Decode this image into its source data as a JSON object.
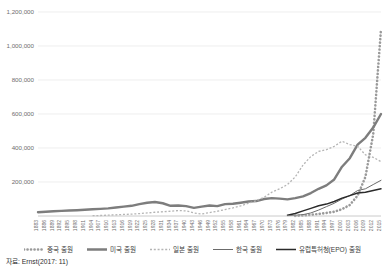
{
  "title_fragment": "",
  "source_note": "자료: Ernst(2017: 11)",
  "legend": {
    "position": "bottom",
    "items": [
      {
        "label": "중국 출원",
        "style": "dotted-thick",
        "color": "#9a9a9a",
        "key": "china"
      },
      {
        "label": "미국 출원",
        "style": "solid-thick",
        "color": "#7d7d7d",
        "key": "usa"
      },
      {
        "label": "일본 출원",
        "style": "dotted-thin",
        "color": "#b4b4b4",
        "key": "japan"
      },
      {
        "label": "한국 출원",
        "style": "solid-thin",
        "color": "#6b6b6b",
        "key": "korea"
      },
      {
        "label": "유럽특허청(EPO) 출원",
        "style": "solid-black",
        "color": "#2b2b2b",
        "key": "epo"
      }
    ]
  },
  "chart_data": {
    "type": "line",
    "title": "",
    "xlabel": "",
    "ylabel": "",
    "grid": true,
    "ylim": [
      0,
      1200000
    ],
    "yticks": [
      200000,
      400000,
      600000,
      800000,
      1000000,
      1200000
    ],
    "ytick_labels": [
      "200,000",
      "400,000",
      "600,000",
      "800,000",
      "1,000,000",
      "1,200,000"
    ],
    "xlim": [
      1883,
      2015
    ],
    "xtick_labels": [
      "1883",
      "1886",
      "1889",
      "1892",
      "1895",
      "1898",
      "1901",
      "1904",
      "1907",
      "1910",
      "1913",
      "1916",
      "1919",
      "1922",
      "1925",
      "1928",
      "1931",
      "1934",
      "1937",
      "1940",
      "1943",
      "1946",
      "1949",
      "1952",
      "1955",
      "1958",
      "1961",
      "1964",
      "1967",
      "1970",
      "1973",
      "1976",
      "1979",
      "1982",
      "1985",
      "1988",
      "1991",
      "1994",
      "1997",
      "2000",
      "2003",
      "2006",
      "2009",
      "2012",
      "2015"
    ],
    "x": [
      1883,
      1886,
      1889,
      1892,
      1895,
      1898,
      1901,
      1904,
      1907,
      1910,
      1913,
      1916,
      1919,
      1922,
      1925,
      1928,
      1931,
      1934,
      1937,
      1940,
      1943,
      1946,
      1949,
      1952,
      1955,
      1958,
      1961,
      1964,
      1967,
      1970,
      1973,
      1976,
      1979,
      1982,
      1985,
      1988,
      1991,
      1994,
      1997,
      2000,
      2003,
      2006,
      2009,
      2012,
      2015
    ],
    "series": [
      {
        "name": "중국 출원",
        "key": "china",
        "color": "#9a9a9a",
        "style": "dotted-thick",
        "values": [
          null,
          null,
          null,
          null,
          null,
          null,
          null,
          null,
          null,
          null,
          null,
          null,
          null,
          null,
          null,
          null,
          null,
          null,
          null,
          null,
          null,
          null,
          null,
          null,
          null,
          null,
          null,
          null,
          null,
          null,
          null,
          null,
          null,
          1000,
          3000,
          7000,
          12000,
          18000,
          25000,
          40000,
          65000,
          120000,
          230000,
          480000,
          1100000
        ]
      },
      {
        "name": "미국 출원",
        "key": "usa",
        "color": "#7d7d7d",
        "style": "solid-thick",
        "values": [
          22000,
          25000,
          28000,
          30000,
          32000,
          34000,
          37000,
          40000,
          42000,
          45000,
          50000,
          55000,
          60000,
          70000,
          78000,
          82000,
          75000,
          60000,
          62000,
          58000,
          48000,
          55000,
          62000,
          58000,
          70000,
          72000,
          78000,
          85000,
          88000,
          100000,
          105000,
          102000,
          98000,
          105000,
          115000,
          135000,
          160000,
          180000,
          215000,
          290000,
          340000,
          420000,
          460000,
          520000,
          600000
        ]
      },
      {
        "name": "일본 출원",
        "key": "japan",
        "color": "#b4b4b4",
        "style": "dotted-thin",
        "values": [
          null,
          null,
          null,
          null,
          null,
          null,
          null,
          2000,
          3000,
          5000,
          7000,
          9000,
          11000,
          14000,
          18000,
          22000,
          25000,
          28000,
          32000,
          30000,
          18000,
          12000,
          20000,
          28000,
          38000,
          48000,
          60000,
          75000,
          90000,
          110000,
          140000,
          160000,
          185000,
          230000,
          300000,
          350000,
          380000,
          390000,
          410000,
          440000,
          420000,
          410000,
          360000,
          345000,
          320000
        ]
      },
      {
        "name": "한국 출원",
        "key": "korea",
        "color": "#6b6b6b",
        "style": "solid-thin",
        "values": [
          null,
          null,
          null,
          null,
          null,
          null,
          null,
          null,
          null,
          null,
          null,
          null,
          null,
          null,
          null,
          null,
          null,
          null,
          null,
          null,
          null,
          null,
          null,
          null,
          null,
          null,
          null,
          null,
          null,
          null,
          null,
          null,
          2000,
          4000,
          8000,
          18000,
          35000,
          55000,
          75000,
          100000,
          120000,
          150000,
          160000,
          185000,
          210000
        ]
      },
      {
        "name": "유럽특허청(EPO) 출원",
        "key": "epo",
        "color": "#2b2b2b",
        "style": "solid-black",
        "values": [
          null,
          null,
          null,
          null,
          null,
          null,
          null,
          null,
          null,
          null,
          null,
          null,
          null,
          null,
          null,
          null,
          null,
          null,
          null,
          null,
          null,
          null,
          null,
          null,
          null,
          null,
          null,
          null,
          null,
          null,
          null,
          null,
          5000,
          15000,
          30000,
          45000,
          60000,
          70000,
          85000,
          105000,
          120000,
          135000,
          140000,
          150000,
          160000
        ]
      }
    ]
  }
}
